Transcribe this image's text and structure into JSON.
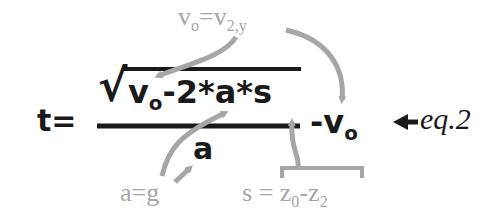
{
  "equation": {
    "lhs": "t=",
    "numerator": {
      "sqrt_symbol": "√",
      "v_base": "v",
      "v_sub": "o",
      "rest": "-2*a*s"
    },
    "denominator": "a",
    "tail": {
      "minus": "-",
      "v_base": "v",
      "v_sub": "o"
    },
    "label": "eq.2"
  },
  "annotations": {
    "top": {
      "v_base": "v",
      "v_sub": "o",
      "eq": "=",
      "rhs_base": "v",
      "rhs_sub": "2,y"
    },
    "bottom_left": {
      "text": "a=g"
    },
    "bottom_right": {
      "lhs": "s",
      "eq": "=",
      "z0_base": "z",
      "z0_sub": "0",
      "minus": "-",
      "z2_base": "z",
      "z2_sub": "2"
    }
  },
  "colors": {
    "main": "#1a1a1a",
    "annotation": "#a6a6a6"
  }
}
